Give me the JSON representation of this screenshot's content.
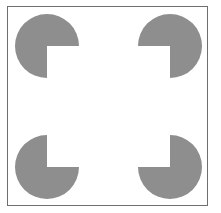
{
  "figure": {
    "type": "kanizsa-square-illusion",
    "background": "#ffffff",
    "frame_color": "#6f6f6f",
    "shape_color": "#8e8e8e",
    "inducers": [
      {
        "position": "top-left",
        "cx": 47,
        "cy": 46,
        "r": 32,
        "missing_quadrant": "bottom-right"
      },
      {
        "position": "top-right",
        "cx": 170,
        "cy": 46,
        "r": 32,
        "missing_quadrant": "bottom-left"
      },
      {
        "position": "bottom-left",
        "cx": 47,
        "cy": 167,
        "r": 32,
        "missing_quadrant": "top-right"
      },
      {
        "position": "bottom-right",
        "cx": 170,
        "cy": 167,
        "r": 32,
        "missing_quadrant": "top-left"
      }
    ]
  }
}
